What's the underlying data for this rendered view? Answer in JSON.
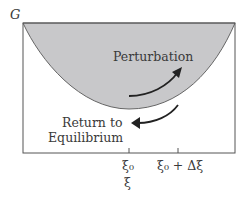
{
  "diagram": {
    "y_axis_label": "G",
    "perturbation_label": "Perturbation",
    "return_label_line1": "Return to",
    "return_label_line2": "Equilibrium",
    "tick1_label": "ξ₀",
    "tick2_label": "ξ₀ + Δξ",
    "x_axis_label": "ξ",
    "colors": {
      "fill": "#c8c8ca",
      "line": "#555555",
      "arrow": "#222222",
      "text": "#3a3a3a"
    }
  }
}
